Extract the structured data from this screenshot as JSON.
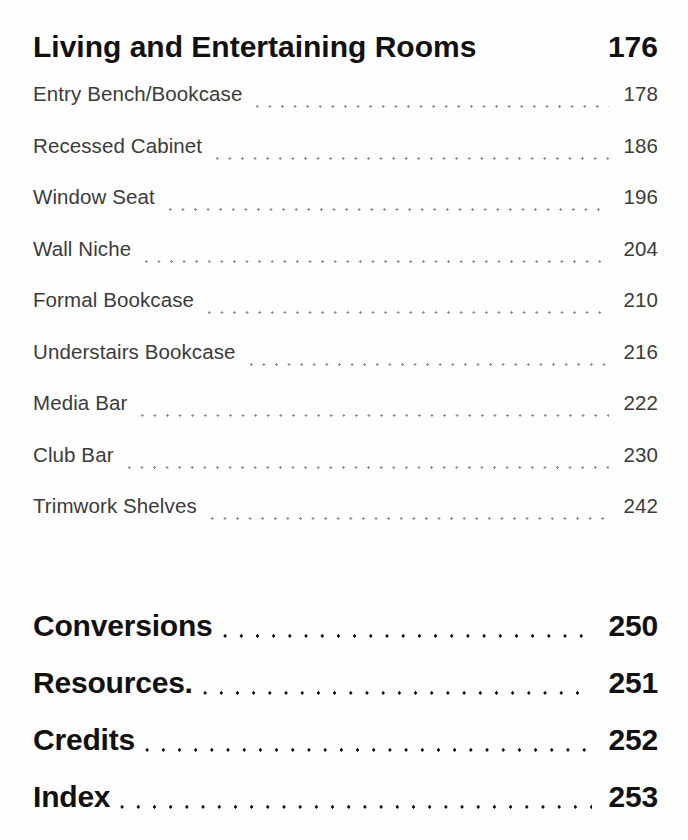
{
  "document": {
    "type": "table-of-contents",
    "background_color": "#fefefe",
    "major_text_color": "#111111",
    "minor_text_color": "#3b3b3b",
    "leader_dot_color_major": "#111111",
    "leader_dot_color_minor": "#8a8a8a"
  },
  "section": {
    "heading": {
      "label": "Living and Entertaining Rooms",
      "page": "176"
    },
    "entries": [
      {
        "label": "Entry Bench/Bookcase",
        "page": "178"
      },
      {
        "label": "Recessed Cabinet",
        "page": "186"
      },
      {
        "label": "Window Seat",
        "page": "196"
      },
      {
        "label": "Wall Niche",
        "page": "204"
      },
      {
        "label": "Formal Bookcase",
        "page": "210"
      },
      {
        "label": "Understairs Bookcase",
        "page": "216"
      },
      {
        "label": "Media Bar",
        "page": "222"
      },
      {
        "label": "Club Bar",
        "page": "230"
      },
      {
        "label": "Trimwork Shelves",
        "page": "242"
      }
    ]
  },
  "back_matter": [
    {
      "label": "Conversions",
      "page": "250"
    },
    {
      "label": "Resources.",
      "page": "251"
    },
    {
      "label": "Credits",
      "page": "252"
    },
    {
      "label": "Index",
      "page": "253"
    }
  ]
}
